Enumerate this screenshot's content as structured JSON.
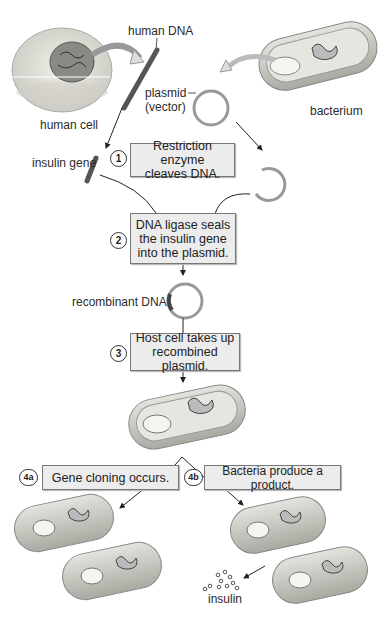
{
  "labels": {
    "human_dna": "human DNA",
    "human_cell": "human cell",
    "plasmid": "plasmid",
    "vector": "(vector)",
    "bacterium": "bacterium",
    "insulin_gene": "insulin gene",
    "recombinant_dna": "recombinant DNA",
    "insulin": "insulin"
  },
  "steps": [
    {
      "number": "1",
      "lines": [
        "Restriction enzyme",
        "cleaves DNA."
      ]
    },
    {
      "number": "2",
      "lines": [
        "DNA ligase seals",
        "the insulin gene",
        "into the plasmid."
      ]
    },
    {
      "number": "3",
      "lines": [
        "Host cell takes up",
        "recombined plasmid."
      ]
    },
    {
      "number": "4a",
      "lines": [
        "Gene cloning occurs."
      ]
    },
    {
      "number": "4b",
      "lines": [
        "Bacteria produce a product."
      ]
    }
  ],
  "colors": {
    "box_fill": "#ececec",
    "box_border": "#777777",
    "cell_fill": "#d8d8d0",
    "line": "#222222"
  }
}
